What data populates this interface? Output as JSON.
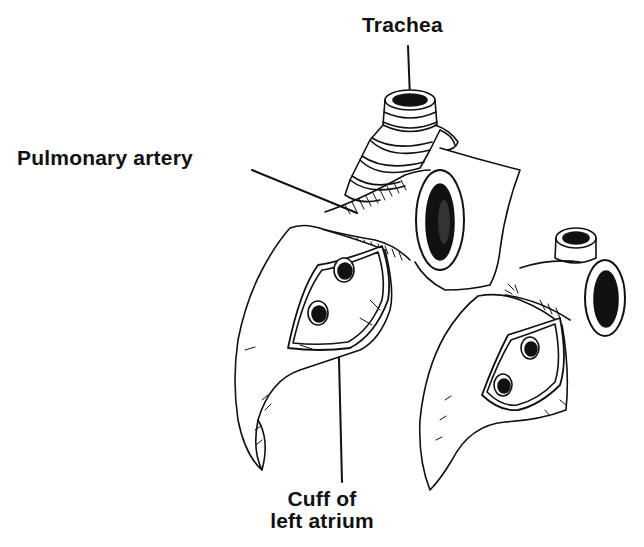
{
  "figure": {
    "style": "black-and-white pen-and-ink medical illustration",
    "colors": {
      "ink": "#111111",
      "background": "#ffffff"
    }
  },
  "labels": {
    "trachea": "Trachea",
    "pulmonary_artery": "Pulmonary artery",
    "cuff_line1": "Cuff of",
    "cuff_line2": "left atrium"
  },
  "structures": [
    {
      "name": "trachea",
      "label": "Trachea"
    },
    {
      "name": "pulmonary-artery",
      "label": "Pulmonary artery"
    },
    {
      "name": "left-lung-hilum",
      "label": ""
    },
    {
      "name": "right-lung-hilum",
      "label": ""
    },
    {
      "name": "left-atrial-cuff",
      "label": "Cuff of left atrium"
    }
  ]
}
